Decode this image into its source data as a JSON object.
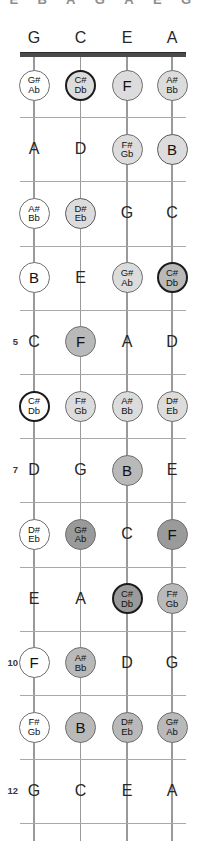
{
  "diagram": {
    "tuning": [
      "G",
      "C",
      "E",
      "A"
    ],
    "string_count": 4,
    "fret_count": 12,
    "clipped_header_glyphs": [
      "E",
      "B",
      "A",
      "G",
      "A",
      "E",
      "G"
    ],
    "fret_markers": [
      "5",
      "7",
      "10",
      "12"
    ],
    "colors": {
      "nut": "#4a4a4a",
      "fret": "#a8a8a8",
      "string": "#9a9a9a",
      "text": "#262626",
      "fill_white": "#ffffff",
      "fill_light": "#dcdcdc",
      "fill_mid": "#b9b9b9",
      "fill_dark": "#9a9a9a",
      "ring_dark": "#1b1b1b"
    }
  },
  "rows": [
    {
      "fret": "0",
      "number_label": "",
      "notes": [
        {
          "text": "G",
          "type": "plain"
        },
        {
          "text": "C",
          "type": "plain"
        },
        {
          "text": "E",
          "type": "plain"
        },
        {
          "text": "A",
          "type": "plain"
        }
      ]
    },
    {
      "fret": "1",
      "number_label": "",
      "notes": [
        {
          "sharp": "G#",
          "flat": "Ab",
          "type": "disc",
          "fill": "f-white",
          "ring": "r-thin"
        },
        {
          "sharp": "C#",
          "flat": "Db",
          "type": "disc",
          "fill": "f-light",
          "ring": "r-thick"
        },
        {
          "text": "F",
          "type": "disc-big",
          "fill": "f-light",
          "ring": "r-thin"
        },
        {
          "sharp": "A#",
          "flat": "Bb",
          "type": "disc",
          "fill": "f-light",
          "ring": "r-thin"
        }
      ]
    },
    {
      "fret": "2",
      "number_label": "",
      "notes": [
        {
          "text": "A",
          "type": "plain"
        },
        {
          "text": "D",
          "type": "plain"
        },
        {
          "sharp": "F#",
          "flat": "Gb",
          "type": "disc",
          "fill": "f-light",
          "ring": "r-thin"
        },
        {
          "text": "B",
          "type": "disc-big",
          "fill": "f-light",
          "ring": "r-mid"
        }
      ]
    },
    {
      "fret": "3",
      "number_label": "",
      "notes": [
        {
          "sharp": "A#",
          "flat": "Bb",
          "type": "disc",
          "fill": "f-white",
          "ring": "r-thin"
        },
        {
          "sharp": "D#",
          "flat": "Eb",
          "type": "disc",
          "fill": "f-light",
          "ring": "r-mid"
        },
        {
          "text": "G",
          "type": "plain"
        },
        {
          "text": "C",
          "type": "plain"
        }
      ]
    },
    {
      "fret": "4",
      "number_label": "",
      "notes": [
        {
          "text": "B",
          "type": "disc-big",
          "fill": "f-white",
          "ring": "r-thin"
        },
        {
          "text": "E",
          "type": "plain"
        },
        {
          "sharp": "G#",
          "flat": "Ab",
          "type": "disc",
          "fill": "f-light",
          "ring": "r-thin"
        },
        {
          "sharp": "C#",
          "flat": "Db",
          "type": "disc",
          "fill": "f-mid",
          "ring": "r-thick"
        }
      ]
    },
    {
      "fret": "5",
      "number_label": "5",
      "notes": [
        {
          "text": "C",
          "type": "plain"
        },
        {
          "text": "F",
          "type": "disc-big",
          "fill": "f-mid",
          "ring": "r-thin"
        },
        {
          "text": "A",
          "type": "plain"
        },
        {
          "text": "D",
          "type": "plain"
        }
      ]
    },
    {
      "fret": "6",
      "number_label": "",
      "notes": [
        {
          "sharp": "C#",
          "flat": "Db",
          "type": "disc",
          "fill": "f-white",
          "ring": "r-thick"
        },
        {
          "sharp": "F#",
          "flat": "Gb",
          "type": "disc",
          "fill": "f-light",
          "ring": "r-thin"
        },
        {
          "sharp": "A#",
          "flat": "Bb",
          "type": "disc",
          "fill": "f-light",
          "ring": "r-thin"
        },
        {
          "sharp": "D#",
          "flat": "Eb",
          "type": "disc",
          "fill": "f-light",
          "ring": "r-thin"
        }
      ]
    },
    {
      "fret": "7",
      "number_label": "7",
      "notes": [
        {
          "text": "D",
          "type": "plain"
        },
        {
          "text": "G",
          "type": "plain"
        },
        {
          "text": "B",
          "type": "disc-big",
          "fill": "f-mid",
          "ring": "r-thin"
        },
        {
          "text": "E",
          "type": "plain"
        }
      ]
    },
    {
      "fret": "8",
      "number_label": "",
      "notes": [
        {
          "sharp": "D#",
          "flat": "Eb",
          "type": "disc",
          "fill": "f-white",
          "ring": "r-thin"
        },
        {
          "sharp": "G#",
          "flat": "Ab",
          "type": "disc",
          "fill": "f-dark",
          "ring": "r-thin"
        },
        {
          "text": "C",
          "type": "plain"
        },
        {
          "text": "F",
          "type": "disc-big",
          "fill": "f-dark",
          "ring": "r-thin"
        }
      ]
    },
    {
      "fret": "9",
      "number_label": "",
      "notes": [
        {
          "text": "E",
          "type": "plain"
        },
        {
          "text": "A",
          "type": "plain"
        },
        {
          "sharp": "C#",
          "flat": "Db",
          "type": "disc",
          "fill": "f-dark",
          "ring": "r-thick"
        },
        {
          "sharp": "F#",
          "flat": "Gb",
          "type": "disc",
          "fill": "f-mid",
          "ring": "r-thin"
        }
      ]
    },
    {
      "fret": "10",
      "number_label": "10",
      "notes": [
        {
          "text": "F",
          "type": "disc-big",
          "fill": "f-white",
          "ring": "r-thin"
        },
        {
          "sharp": "A#",
          "flat": "Bb",
          "type": "disc",
          "fill": "f-mid",
          "ring": "r-thin"
        },
        {
          "text": "D",
          "type": "plain"
        },
        {
          "text": "G",
          "type": "plain"
        }
      ]
    },
    {
      "fret": "11",
      "number_label": "",
      "notes": [
        {
          "sharp": "F#",
          "flat": "Gb",
          "type": "disc",
          "fill": "f-white",
          "ring": "r-thin"
        },
        {
          "text": "B",
          "type": "disc-big",
          "fill": "f-mid",
          "ring": "r-thin"
        },
        {
          "sharp": "D#",
          "flat": "Eb",
          "type": "disc",
          "fill": "f-mid",
          "ring": "r-thin"
        },
        {
          "sharp": "G#",
          "flat": "Ab",
          "type": "disc",
          "fill": "f-mid",
          "ring": "r-thin"
        }
      ]
    },
    {
      "fret": "12",
      "number_label": "12",
      "notes": [
        {
          "text": "G",
          "type": "plain"
        },
        {
          "text": "C",
          "type": "plain"
        },
        {
          "text": "E",
          "type": "plain"
        },
        {
          "text": "A",
          "type": "plain"
        }
      ]
    }
  ]
}
